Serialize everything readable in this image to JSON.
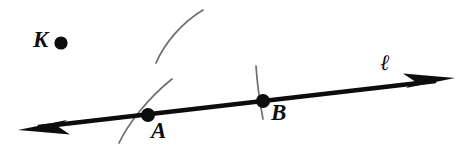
{
  "figure": {
    "width": 459,
    "height": 147,
    "background_color": "#ffffff",
    "ink_color": "#0d0d0d",
    "construction_arc_color": "#6e6e6e"
  },
  "labels": {
    "point_k": "K",
    "point_a": "A",
    "point_b": "B",
    "line": "ℓ"
  },
  "elements": {
    "line_ell": {
      "name": "line-ell",
      "type": "double-headed-line",
      "from": [
        22,
        129
      ],
      "to": [
        452,
        79
      ],
      "stroke_width": 4.5,
      "arrowheads": [
        "start",
        "end"
      ]
    },
    "point_k": {
      "name": "point-k",
      "type": "dot",
      "center": [
        61,
        43
      ],
      "radius": 6.5
    },
    "point_a": {
      "name": "point-a",
      "type": "dot",
      "center": [
        148,
        115
      ],
      "radius": 7
    },
    "point_b": {
      "name": "point-b",
      "type": "dot",
      "center": [
        263,
        101
      ],
      "radius": 7
    },
    "arc_upper": {
      "name": "construction-arc-upper",
      "type": "arc",
      "from": [
        156,
        63
      ],
      "to": [
        203,
        10
      ],
      "stroke_width": 1.6
    },
    "arc_through_a": {
      "name": "construction-arc-through-a",
      "type": "arc",
      "from": [
        119,
        143
      ],
      "to": [
        172,
        79
      ],
      "stroke_width": 1.6
    },
    "tick_at_b": {
      "name": "construction-tick-at-b",
      "type": "arc",
      "from": [
        256,
        66
      ],
      "to": [
        263,
        119
      ],
      "stroke_width": 1.6
    }
  }
}
